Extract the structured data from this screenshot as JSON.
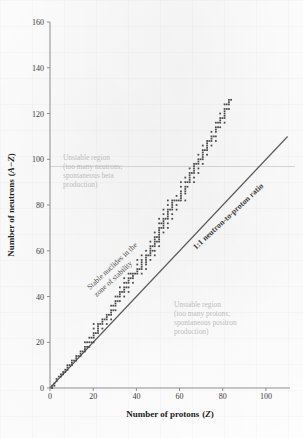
{
  "figure": {
    "background_color": "#fdfdfd",
    "ink_color": "#4a4a4a",
    "axis_color": "#8d8d8d",
    "annotation_gray": "#bdbdbd"
  },
  "axes": {
    "x_title": "Number of protons (Z)",
    "x_title_plain": "Number of protons",
    "x_symbol": "Z",
    "y_title": "Number of neutrons (A−Z)",
    "y_title_plain": "Number of neutrons",
    "y_symbol": "A−Z",
    "x_ticks": [
      0,
      20,
      40,
      60,
      80,
      100
    ],
    "y_ticks": [
      0,
      20,
      40,
      60,
      80,
      100,
      120,
      140,
      160
    ]
  },
  "annotations": {
    "unstable_neutrons": {
      "lines": [
        "Unstable region",
        "(too many neutrons;",
        "spontaneous beta",
        "production)"
      ],
      "color": "#bdbdbd"
    },
    "unstable_protons": {
      "lines": [
        "Unstable region",
        "(too many protons;",
        "spontaneous positron",
        "production)"
      ],
      "color": "#bdbdbd"
    },
    "stable_band": {
      "lines": [
        "Stable nuclides in the",
        "zone of stability"
      ],
      "rotation_deg": -43,
      "color": "#4d4d4d"
    },
    "ratio_line": {
      "label": "1:1 neutron-to-proton ratio",
      "rotation_deg": -43,
      "color": "#404040"
    }
  },
  "chart_data": {
    "type": "scatter",
    "title": "",
    "subtitle": "",
    "xlabel": "Number of protons (Z)",
    "ylabel": "Number of neutrons (A−Z)",
    "xlim": [
      0,
      110
    ],
    "ylim": [
      0,
      160
    ],
    "grid": false,
    "legend": "none",
    "series": [
      {
        "name": "Stable nuclides (band of stability)",
        "marker": "square",
        "color": "#4a4a4a",
        "comment": "Each point is (Z, N) for a stable or near-stable nuclide; band hugs N=Z at low Z then rises to N/Z ~1.5 at Z~83.",
        "points": [
          [
            1,
            0
          ],
          [
            1,
            1
          ],
          [
            2,
            1
          ],
          [
            2,
            2
          ],
          [
            3,
            3
          ],
          [
            3,
            4
          ],
          [
            4,
            5
          ],
          [
            5,
            5
          ],
          [
            5,
            6
          ],
          [
            6,
            6
          ],
          [
            6,
            7
          ],
          [
            7,
            7
          ],
          [
            7,
            8
          ],
          [
            8,
            8
          ],
          [
            8,
            9
          ],
          [
            8,
            10
          ],
          [
            9,
            10
          ],
          [
            10,
            10
          ],
          [
            10,
            11
          ],
          [
            10,
            12
          ],
          [
            11,
            12
          ],
          [
            12,
            12
          ],
          [
            12,
            13
          ],
          [
            12,
            14
          ],
          [
            13,
            14
          ],
          [
            14,
            14
          ],
          [
            14,
            15
          ],
          [
            14,
            16
          ],
          [
            15,
            16
          ],
          [
            16,
            16
          ],
          [
            16,
            17
          ],
          [
            16,
            18
          ],
          [
            16,
            20
          ],
          [
            17,
            18
          ],
          [
            17,
            20
          ],
          [
            18,
            18
          ],
          [
            18,
            20
          ],
          [
            18,
            22
          ],
          [
            19,
            20
          ],
          [
            19,
            22
          ],
          [
            20,
            20
          ],
          [
            20,
            22
          ],
          [
            20,
            23
          ],
          [
            20,
            24
          ],
          [
            20,
            26
          ],
          [
            20,
            28
          ],
          [
            21,
            24
          ],
          [
            22,
            24
          ],
          [
            22,
            25
          ],
          [
            22,
            26
          ],
          [
            22,
            27
          ],
          [
            22,
            28
          ],
          [
            23,
            28
          ],
          [
            24,
            26
          ],
          [
            24,
            28
          ],
          [
            24,
            29
          ],
          [
            24,
            30
          ],
          [
            25,
            30
          ],
          [
            26,
            28
          ],
          [
            26,
            30
          ],
          [
            26,
            31
          ],
          [
            26,
            32
          ],
          [
            27,
            32
          ],
          [
            28,
            30
          ],
          [
            28,
            32
          ],
          [
            28,
            33
          ],
          [
            28,
            34
          ],
          [
            28,
            36
          ],
          [
            29,
            34
          ],
          [
            29,
            36
          ],
          [
            30,
            34
          ],
          [
            30,
            36
          ],
          [
            30,
            37
          ],
          [
            30,
            38
          ],
          [
            30,
            40
          ],
          [
            31,
            38
          ],
          [
            31,
            40
          ],
          [
            32,
            38
          ],
          [
            32,
            40
          ],
          [
            32,
            41
          ],
          [
            32,
            42
          ],
          [
            32,
            44
          ],
          [
            33,
            42
          ],
          [
            34,
            40
          ],
          [
            34,
            42
          ],
          [
            34,
            43
          ],
          [
            34,
            44
          ],
          [
            34,
            46
          ],
          [
            34,
            48
          ],
          [
            35,
            44
          ],
          [
            35,
            46
          ],
          [
            36,
            42
          ],
          [
            36,
            44
          ],
          [
            36,
            46
          ],
          [
            36,
            47
          ],
          [
            36,
            48
          ],
          [
            36,
            50
          ],
          [
            37,
            48
          ],
          [
            37,
            50
          ],
          [
            38,
            46
          ],
          [
            38,
            48
          ],
          [
            38,
            49
          ],
          [
            38,
            50
          ],
          [
            39,
            50
          ],
          [
            40,
            50
          ],
          [
            40,
            51
          ],
          [
            40,
            52
          ],
          [
            40,
            54
          ],
          [
            40,
            56
          ],
          [
            41,
            52
          ],
          [
            42,
            50
          ],
          [
            42,
            52
          ],
          [
            42,
            53
          ],
          [
            42,
            54
          ],
          [
            42,
            55
          ],
          [
            42,
            56
          ],
          [
            42,
            58
          ],
          [
            44,
            52
          ],
          [
            44,
            54
          ],
          [
            44,
            55
          ],
          [
            44,
            56
          ],
          [
            44,
            57
          ],
          [
            44,
            58
          ],
          [
            44,
            60
          ],
          [
            45,
            58
          ],
          [
            46,
            56
          ],
          [
            46,
            58
          ],
          [
            46,
            59
          ],
          [
            46,
            60
          ],
          [
            46,
            61
          ],
          [
            46,
            62
          ],
          [
            46,
            64
          ],
          [
            47,
            60
          ],
          [
            47,
            62
          ],
          [
            48,
            58
          ],
          [
            48,
            60
          ],
          [
            48,
            62
          ],
          [
            48,
            63
          ],
          [
            48,
            64
          ],
          [
            48,
            65
          ],
          [
            48,
            66
          ],
          [
            48,
            68
          ],
          [
            49,
            64
          ],
          [
            49,
            66
          ],
          [
            50,
            62
          ],
          [
            50,
            64
          ],
          [
            50,
            65
          ],
          [
            50,
            66
          ],
          [
            50,
            67
          ],
          [
            50,
            68
          ],
          [
            50,
            69
          ],
          [
            50,
            70
          ],
          [
            50,
            72
          ],
          [
            50,
            74
          ],
          [
            51,
            70
          ],
          [
            51,
            72
          ],
          [
            52,
            68
          ],
          [
            52,
            70
          ],
          [
            52,
            71
          ],
          [
            52,
            72
          ],
          [
            52,
            73
          ],
          [
            52,
            74
          ],
          [
            52,
            76
          ],
          [
            52,
            78
          ],
          [
            53,
            74
          ],
          [
            54,
            70
          ],
          [
            54,
            72
          ],
          [
            54,
            74
          ],
          [
            54,
            75
          ],
          [
            54,
            76
          ],
          [
            54,
            77
          ],
          [
            54,
            78
          ],
          [
            54,
            80
          ],
          [
            54,
            82
          ],
          [
            55,
            78
          ],
          [
            56,
            74
          ],
          [
            56,
            76
          ],
          [
            56,
            78
          ],
          [
            56,
            79
          ],
          [
            56,
            80
          ],
          [
            56,
            81
          ],
          [
            56,
            82
          ],
          [
            57,
            82
          ],
          [
            58,
            78
          ],
          [
            58,
            80
          ],
          [
            58,
            82
          ],
          [
            58,
            84
          ],
          [
            59,
            82
          ],
          [
            60,
            82
          ],
          [
            60,
            83
          ],
          [
            60,
            84
          ],
          [
            60,
            85
          ],
          [
            60,
            86
          ],
          [
            60,
            88
          ],
          [
            60,
            90
          ],
          [
            62,
            82
          ],
          [
            62,
            85
          ],
          [
            62,
            86
          ],
          [
            62,
            87
          ],
          [
            62,
            88
          ],
          [
            62,
            90
          ],
          [
            62,
            92
          ],
          [
            63,
            88
          ],
          [
            63,
            90
          ],
          [
            64,
            90
          ],
          [
            64,
            91
          ],
          [
            64,
            92
          ],
          [
            64,
            93
          ],
          [
            64,
            94
          ],
          [
            64,
            96
          ],
          [
            65,
            94
          ],
          [
            66,
            90
          ],
          [
            66,
            92
          ],
          [
            66,
            94
          ],
          [
            66,
            95
          ],
          [
            66,
            96
          ],
          [
            66,
            97
          ],
          [
            66,
            98
          ],
          [
            67,
            98
          ],
          [
            68,
            94
          ],
          [
            68,
            96
          ],
          [
            68,
            98
          ],
          [
            68,
            99
          ],
          [
            68,
            100
          ],
          [
            68,
            102
          ],
          [
            69,
            100
          ],
          [
            70,
            98
          ],
          [
            70,
            100
          ],
          [
            70,
            101
          ],
          [
            70,
            102
          ],
          [
            70,
            103
          ],
          [
            70,
            104
          ],
          [
            70,
            106
          ],
          [
            71,
            104
          ],
          [
            72,
            102
          ],
          [
            72,
            104
          ],
          [
            72,
            105
          ],
          [
            72,
            106
          ],
          [
            72,
            107
          ],
          [
            72,
            108
          ],
          [
            73,
            108
          ],
          [
            74,
            106
          ],
          [
            74,
            108
          ],
          [
            74,
            109
          ],
          [
            74,
            110
          ],
          [
            74,
            112
          ],
          [
            75,
            110
          ],
          [
            76,
            108
          ],
          [
            76,
            110
          ],
          [
            76,
            112
          ],
          [
            76,
            113
          ],
          [
            76,
            114
          ],
          [
            76,
            116
          ],
          [
            77,
            114
          ],
          [
            77,
            116
          ],
          [
            78,
            114
          ],
          [
            78,
            116
          ],
          [
            117,
            0
          ],
          [
            78,
            117
          ],
          [
            78,
            118
          ],
          [
            78,
            120
          ],
          [
            79,
            118
          ],
          [
            80,
            116
          ],
          [
            80,
            118
          ],
          [
            80,
            119
          ],
          [
            80,
            120
          ],
          [
            80,
            121
          ],
          [
            80,
            122
          ],
          [
            80,
            124
          ],
          [
            81,
            122
          ],
          [
            81,
            124
          ],
          [
            82,
            122
          ],
          [
            82,
            124
          ],
          [
            82,
            125
          ],
          [
            82,
            126
          ],
          [
            83,
            126
          ]
        ]
      },
      {
        "name": "1:1 neutron-to-proton ratio",
        "type": "line",
        "color": "#5a5a5a",
        "from": [
          0,
          0
        ],
        "to": [
          110,
          110
        ]
      }
    ]
  }
}
